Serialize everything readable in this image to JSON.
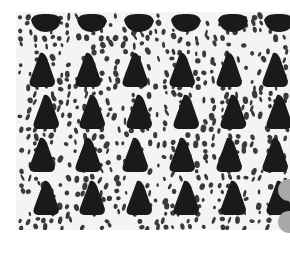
{
  "image": {
    "subject": "knitted lace fabric swatch",
    "description": "White knitted lace with staggered rows of dark triangular eyelet holes on a black backing; two grey circular marks at the right edge",
    "colors": {
      "background": "#ffffff",
      "yarn": "#f4f4f4",
      "holes": "#1a1a1a",
      "small_holes": "#3a3a3a",
      "edge_marks": "#a8a8a8"
    },
    "hole_rows": 5,
    "hole_columns": 6
  }
}
